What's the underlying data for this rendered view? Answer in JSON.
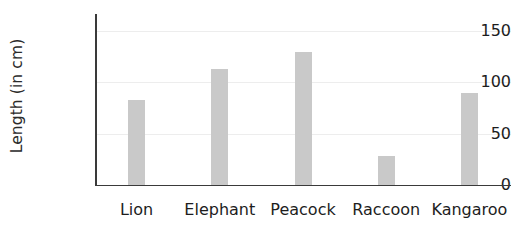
{
  "chart_data": {
    "type": "bar",
    "title": "",
    "subtitle": "",
    "xlabel": "",
    "ylabel": "Length (in cm)",
    "categories": [
      "Lion",
      "Elephant",
      "Peacock",
      "Raccoon",
      "Kangaroo"
    ],
    "values": [
      83,
      113,
      130,
      28,
      90
    ],
    "ylim": [
      0,
      160
    ],
    "yticks": [
      0,
      50,
      100,
      150
    ],
    "ytick_labels": [
      "0",
      "50",
      "100",
      "150"
    ],
    "grid": true,
    "grid_axis": "y",
    "legend": false,
    "legend_position": "none",
    "bar_color": "#c9c9c9",
    "axis_color": "#3a3a3a",
    "gridline_color": "#ededed",
    "text_color": "#1d1d1d",
    "series": [
      {
        "name": "Length",
        "values": [
          83,
          113,
          130,
          28,
          90
        ]
      }
    ]
  }
}
